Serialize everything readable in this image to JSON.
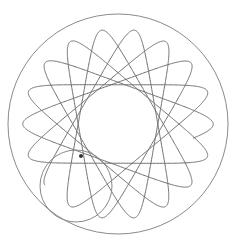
{
  "canvas": {
    "width": 240,
    "height": 248,
    "background": "#ffffff"
  },
  "spirograph": {
    "type": "hypotrochoid",
    "center": [
      118,
      124
    ],
    "outer_ring": {
      "radius": 110,
      "stroke": "#8a8a8a",
      "stroke_width": 1
    },
    "rolling_gear": {
      "center": [
        76,
        186
      ],
      "radius": 36,
      "stroke": "#8a8a8a",
      "stroke_width": 1
    },
    "pen": {
      "position": [
        81,
        156
      ],
      "radius": 2,
      "color": "#333333"
    },
    "curve": {
      "fixed_radius": 110,
      "rolling_radius": 42.78,
      "pen_offset": 28,
      "lobes": 18,
      "start_angle_deg": 140,
      "sweep_turns": 6.7,
      "stroke": "#6e6e6e",
      "stroke_width": 1
    }
  }
}
